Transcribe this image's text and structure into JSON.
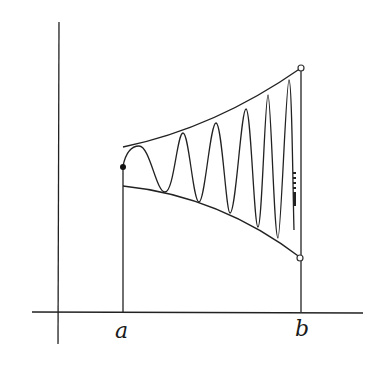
{
  "figure": {
    "labels": {
      "a": "a",
      "b": "b"
    },
    "colors": {
      "stroke": "#222222",
      "background": "#ffffff"
    },
    "markers": {
      "start_point": "filled-dot",
      "upper_endpoint": "open-circle",
      "lower_endpoint": "open-circle"
    }
  }
}
